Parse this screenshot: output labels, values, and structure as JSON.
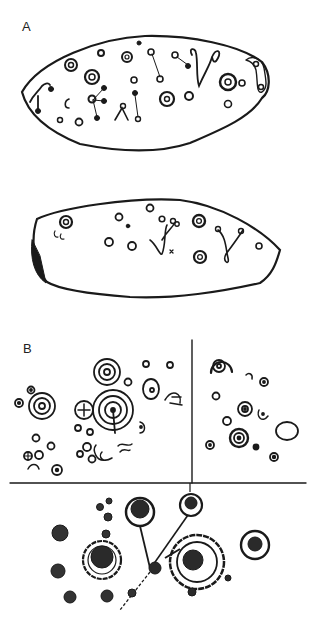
{
  "figure": {
    "panel_a_label": "A",
    "panel_b_label": "B",
    "ink_color": "#1a1a1a",
    "background": "#ffffff"
  }
}
